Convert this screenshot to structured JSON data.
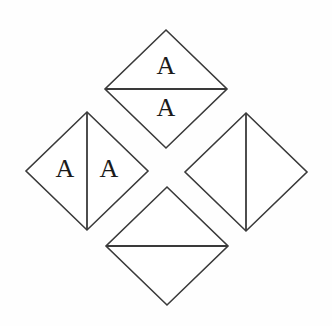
{
  "figure": {
    "title": "",
    "background_color": "#fefefe",
    "stroke_color": "#3a3a3a",
    "glyph_color": "#1a1a1a",
    "shape_count": 4,
    "shape_type": "diamond"
  },
  "shapes": {
    "top": {
      "name": "top-diamond",
      "center_x": 166,
      "center_y": 89,
      "half_width": 61,
      "half_height": 59,
      "divider_orientation": "horizontal",
      "labels": [
        {
          "text": "A",
          "x": 166,
          "y": 68
        },
        {
          "text": "A",
          "x": 166,
          "y": 110
        }
      ]
    },
    "left": {
      "name": "left-diamond",
      "center_x": 87,
      "center_y": 171,
      "half_width": 61,
      "half_height": 59,
      "divider_orientation": "vertical",
      "labels": [
        {
          "text": "A",
          "x": 65,
          "y": 171
        },
        {
          "text": "A",
          "x": 109,
          "y": 171
        }
      ]
    },
    "right": {
      "name": "right-diamond",
      "center_x": 246,
      "center_y": 172,
      "half_width": 61,
      "half_height": 59,
      "divider_orientation": "vertical",
      "labels": []
    },
    "bottom": {
      "name": "bottom-diamond",
      "center_x": 167,
      "center_y": 246,
      "half_width": 61,
      "half_height": 59,
      "divider_orientation": "horizontal",
      "labels": []
    }
  }
}
